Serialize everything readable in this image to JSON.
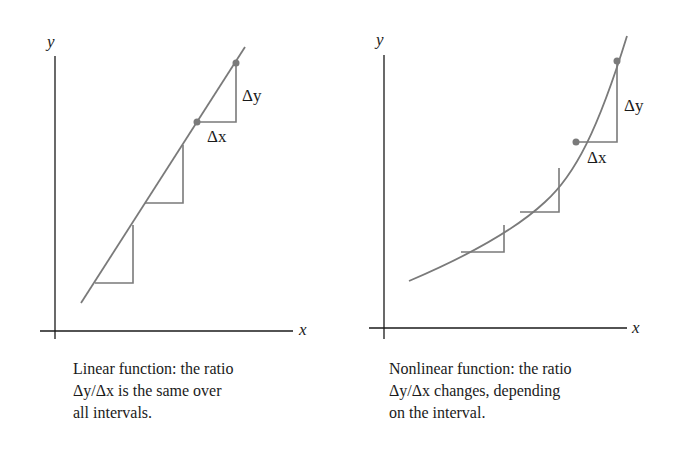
{
  "panels": [
    {
      "id": "linear",
      "axis_labels": {
        "x": "x",
        "y": "y"
      },
      "delta_labels": {
        "dy": "Δy",
        "dx": "Δx"
      },
      "caption_lines": [
        "Linear function: the ratio",
        "Δy/Δx is the same over",
        "all intervals."
      ]
    },
    {
      "id": "nonlinear",
      "axis_labels": {
        "x": "x",
        "y": "y"
      },
      "delta_labels": {
        "dy": "Δy",
        "dx": "Δx"
      },
      "caption_lines": [
        "Nonlinear function: the ratio",
        "Δy/Δx changes, depending",
        "on the interval."
      ]
    }
  ],
  "colors": {
    "axis": "#1a1a1a",
    "curve": "#7a7a7a",
    "point": "#7a7a7a"
  }
}
